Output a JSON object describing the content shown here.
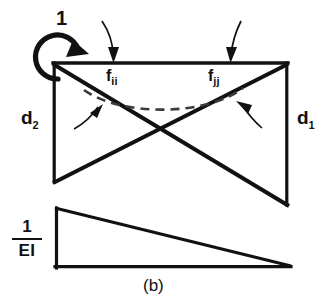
{
  "figure": {
    "caption": "(b)",
    "labels": {
      "unit_moment": "1",
      "d2": "d",
      "d2_sub": "2",
      "d1": "d",
      "d1_sub": "1",
      "fii": "f",
      "fii_sub": "ii",
      "fjj": "f",
      "fjj_sub": "jj",
      "ei_numerator": "1",
      "ei_denominator": "EI"
    },
    "colors": {
      "ink": "#111111",
      "background": "#ffffff",
      "dashed_curve": "#3a3a3a"
    },
    "geometry": {
      "top_beam": {
        "x1": 53,
        "y1": 63,
        "x2": 288,
        "y2": 63
      },
      "left_vertical": {
        "x1": 53,
        "y1": 63,
        "x2": 53,
        "y2": 182
      },
      "right_vertical": {
        "x1": 288,
        "y1": 63,
        "x2": 288,
        "y2": 205
      },
      "diagonal_left_down": {
        "x1": 53,
        "y1": 63,
        "x2": 288,
        "y2": 205
      },
      "diagonal_right_up": {
        "x1": 288,
        "y1": 63,
        "x2": 53,
        "y2": 182
      },
      "lower_triangle": {
        "x1": 55,
        "y1": 208,
        "x2": 55,
        "y2": 268,
        "x3": 289,
        "y3": 268
      }
    }
  }
}
